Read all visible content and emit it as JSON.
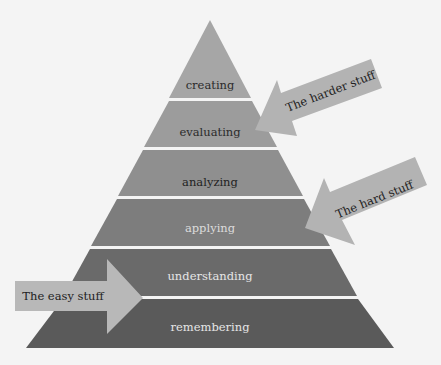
{
  "diagram": {
    "type": "pyramid",
    "levels": [
      {
        "label": "creating",
        "fill": "#a6a6a6",
        "text_color": "#2b2b2b"
      },
      {
        "label": "evaluating",
        "fill": "#9c9c9c",
        "text_color": "#2b2b2b"
      },
      {
        "label": "analyzing",
        "fill": "#8f8f8f",
        "text_color": "#222222"
      },
      {
        "label": "applying",
        "fill": "#7d7d7d",
        "text_color": "#dcdcdc"
      },
      {
        "label": "understanding",
        "fill": "#6a6a6a",
        "text_color": "#e6e6e6"
      },
      {
        "label": "remembering",
        "fill": "#5a5a5a",
        "text_color": "#e6e6e6"
      }
    ],
    "arrows": [
      {
        "label": "The harder stuff",
        "fill": "#b3b3b3"
      },
      {
        "label": "The hard stuff",
        "fill": "#b3b3b3"
      },
      {
        "label": "The easy stuff",
        "fill": "#b8b8b8"
      }
    ],
    "divider_color": "#f4f4f4",
    "background": "#f4f4f4"
  }
}
